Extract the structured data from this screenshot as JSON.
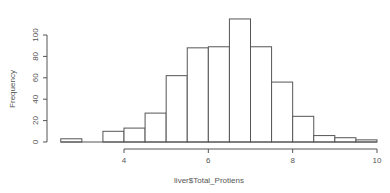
{
  "chart_data": {
    "type": "bar",
    "subtype": "histogram",
    "title": "",
    "xlabel": "liver$Total_Protiens",
    "ylabel": "Frequency",
    "bin_edges": [
      2.5,
      3.0,
      3.5,
      4.0,
      4.5,
      5.0,
      5.5,
      6.0,
      6.5,
      7.0,
      7.5,
      8.0,
      8.5,
      9.0,
      9.5,
      10.0
    ],
    "values": [
      3,
      0,
      10,
      13,
      27,
      62,
      88,
      89,
      115,
      89,
      56,
      24,
      6,
      4,
      2
    ],
    "xlim": [
      2.5,
      10
    ],
    "ylim": [
      0,
      115
    ],
    "x_ticks": [
      4,
      6,
      8,
      10
    ],
    "x_tick_labels": [
      "4",
      "6",
      "8",
      "10"
    ],
    "y_ticks": [
      0,
      20,
      40,
      60,
      80,
      100
    ],
    "y_tick_labels": [
      "0",
      "20",
      "40",
      "60",
      "80",
      "100"
    ],
    "grid": false,
    "legend": "none",
    "bar_fill": "#ffffff",
    "bar_stroke": "#555555"
  }
}
